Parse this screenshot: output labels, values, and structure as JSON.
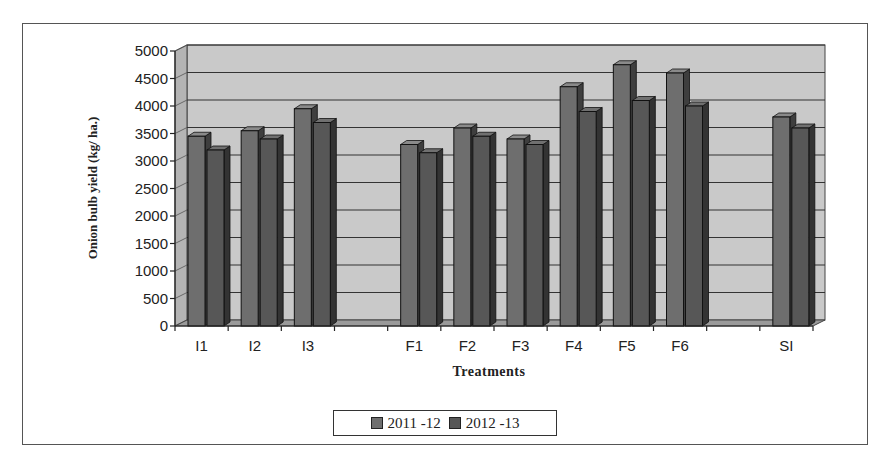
{
  "chart_data": {
    "type": "bar",
    "style": "3d-clustered-column",
    "title": "",
    "xlabel": "Treatments",
    "ylabel": "Onion bulb yield (kg/ ha.)",
    "ylim": [
      0,
      5000
    ],
    "yticks": [
      0,
      500,
      1000,
      1500,
      2000,
      2500,
      3000,
      3500,
      4000,
      4500,
      5000
    ],
    "grid": true,
    "legend_position": "bottom",
    "categories": [
      "I1",
      "I2",
      "I3",
      "",
      "F1",
      "F2",
      "F3",
      "F4",
      "F5",
      "F6",
      "",
      "SI"
    ],
    "category_labels": [
      "I1",
      "I2",
      "I3",
      "",
      "F1",
      "F2",
      "F3",
      "F4",
      "F5",
      "F6",
      "",
      "SI"
    ],
    "series": [
      {
        "name": "2011 -12",
        "color": "#6e6e6e",
        "values": [
          3450,
          3550,
          3950,
          null,
          3300,
          3600,
          3400,
          4350,
          4750,
          4600,
          null,
          3800
        ]
      },
      {
        "name": "2012 -13",
        "color": "#575757",
        "values": [
          3200,
          3400,
          3700,
          null,
          3150,
          3450,
          3300,
          3900,
          4100,
          4000,
          null,
          3600
        ]
      }
    ]
  },
  "legend": {
    "items": [
      {
        "label": "2011 -12",
        "color": "#6e6e6e"
      },
      {
        "label": "2012 -13",
        "color": "#575757"
      }
    ]
  }
}
